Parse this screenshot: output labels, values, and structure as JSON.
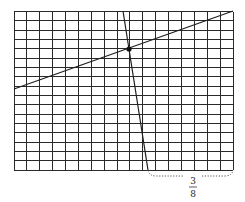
{
  "diagram": {
    "type": "grid-with-lines",
    "grid": {
      "columns": 17,
      "rows": 17,
      "x_start": 14,
      "x_end": 233,
      "y_start": 11.5,
      "y_end": 170,
      "line_color": "#2a2a2a"
    },
    "lines": [
      {
        "name": "shallow-line",
        "from": [
          14,
          89
        ],
        "to": [
          233,
          11
        ],
        "color": "#1e1e1e"
      },
      {
        "name": "steep-line",
        "from": [
          123,
          11
        ],
        "to": [
          148,
          170
        ],
        "color": "#1e1e1e"
      }
    ],
    "intersection_point": {
      "x": 129,
      "y": 49,
      "color": "#111111"
    },
    "brace": {
      "style": "dotted",
      "from_x": 148,
      "to_x": 233,
      "baseline_y": 170,
      "depth_y": 176,
      "label": {
        "numerator": "3",
        "denominator": "8",
        "x": 193
      }
    }
  }
}
